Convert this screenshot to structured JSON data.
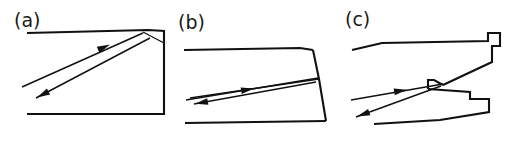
{
  "figure": {
    "background_color": "#ffffff",
    "line_color": "#111111",
    "width": 507,
    "height": 142,
    "panels": [
      {
        "id": "a",
        "label": "(a)",
        "label_x": 14,
        "label_y": 27,
        "description": "wedge cavity with flat top, flat bottom and vertical right wall",
        "surfaces": [
          {
            "name": "top-wall",
            "points": "27,33 148,30 165,31"
          },
          {
            "name": "right-wall-and-bottom",
            "points": "164,31 164,114 27,114"
          },
          {
            "name": "inclined-reflector",
            "points": "143,32 164,43"
          }
        ],
        "rays": [
          {
            "name": "incident-ray",
            "direction": "up-right",
            "points": "22,87 143,33",
            "arrow_at": "108,45",
            "arrow_angle": -24
          },
          {
            "name": "reflected-ray",
            "direction": "down-left",
            "points": "150,38 36,98",
            "arrow_at": "41,96",
            "arrow_angle": 152
          }
        ]
      },
      {
        "id": "b",
        "label": "(b)",
        "label_x": 178,
        "label_y": 29,
        "description": "tapered wedge cavity, right wall slanted outward, shallow inclined reflector",
        "surfaces": [
          {
            "name": "top-wall",
            "points": "184,50 300,48 313,50"
          },
          {
            "name": "right-wall",
            "points": "313,50 319,79 326,121"
          },
          {
            "name": "bottom-wall",
            "points": "326,121 185,123"
          },
          {
            "name": "inclined-reflector",
            "points": "190,98 319,79"
          }
        ],
        "rays": [
          {
            "name": "incident-ray",
            "direction": "up-right",
            "points": "186,100 318,78",
            "arrow_at": "252,89",
            "arrow_angle": -9
          },
          {
            "name": "reflected-ray",
            "direction": "down-left",
            "points": "316,82 194,104",
            "arrow_at": "199,103",
            "arrow_angle": 170
          }
        ]
      },
      {
        "id": "c",
        "label": "(c)",
        "label_x": 345,
        "label_y": 26,
        "description": "stepped notch cavity with re-entrant groove and two jaw surfaces",
        "surfaces": [
          {
            "name": "upper-jaw",
            "points": "352,50 382,43 488,41 488,33 500,33 500,46 492,46 492,62 443,85"
          },
          {
            "name": "groove-upper-face",
            "points": "443,85 434,80 428,80 428,89"
          },
          {
            "name": "lower-jaw",
            "points": "428,89 470,92 470,99 489,99 489,112 440,120 374,124"
          }
        ],
        "rays": [
          {
            "name": "incident-ray",
            "direction": "up-right",
            "points": "351,100 443,84",
            "arrow_at": "405,90",
            "arrow_angle": -10
          },
          {
            "name": "reflected-ray",
            "direction": "down-left",
            "points": "441,86 356,117",
            "arrow_at": "362,115",
            "arrow_angle": 160
          }
        ]
      }
    ]
  }
}
